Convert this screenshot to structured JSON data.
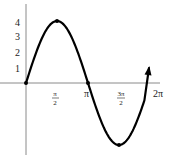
{
  "chart_data": {
    "type": "line",
    "title": "",
    "xlabel": "",
    "ylabel": "",
    "function": "y = 4 sin(x)",
    "x_ticks": [
      {
        "value": 1.5708,
        "label_num": "π",
        "label_den": "2"
      },
      {
        "value": 3.1416,
        "label": "π"
      },
      {
        "value": 4.7124,
        "label_num": "3π",
        "label_den": "2"
      },
      {
        "value": 6.2832,
        "label": "2π"
      }
    ],
    "y_ticks": [
      {
        "value": 1,
        "label": "1"
      },
      {
        "value": 2,
        "label": "2"
      },
      {
        "value": 3,
        "label": "3"
      },
      {
        "value": 4,
        "label": "4"
      }
    ],
    "xlim": [
      0,
      6.2832
    ],
    "ylim": [
      -4,
      4
    ],
    "x": [
      0,
      0.7854,
      1.5708,
      2.3562,
      3.1416,
      3.927,
      4.7124,
      5.4978,
      6.0
    ],
    "values": [
      0,
      2.83,
      4,
      2.83,
      0,
      -2.83,
      -4,
      -2.83,
      -1.12
    ],
    "marked_points": [
      {
        "x": 0,
        "y": 0
      },
      {
        "x": 1.5708,
        "y": 4
      },
      {
        "x": 3.1416,
        "y": 0
      },
      {
        "x": 4.7124,
        "y": -4
      }
    ],
    "end_arrow": true,
    "grid": false,
    "legend": null,
    "colors": {
      "curve": "#000000",
      "axis": "#888888"
    }
  }
}
